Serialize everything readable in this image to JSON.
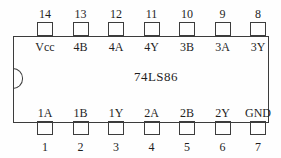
{
  "chip": {
    "part_number": "74LS86",
    "package": "DIP-14",
    "colors": {
      "ink": "#3c3c3c",
      "text": "#1e1e1e",
      "background": "#fefefe"
    },
    "top_pins": [
      {
        "number": "14",
        "label": "Vcc"
      },
      {
        "number": "13",
        "label": "4B"
      },
      {
        "number": "12",
        "label": "4A"
      },
      {
        "number": "11",
        "label": "4Y"
      },
      {
        "number": "10",
        "label": "3B"
      },
      {
        "number": "9",
        "label": "3A"
      },
      {
        "number": "8",
        "label": "3Y"
      }
    ],
    "bottom_pins": [
      {
        "number": "1",
        "label": "1A"
      },
      {
        "number": "2",
        "label": "1B"
      },
      {
        "number": "3",
        "label": "1Y"
      },
      {
        "number": "4",
        "label": "2A"
      },
      {
        "number": "5",
        "label": "2B"
      },
      {
        "number": "6",
        "label": "2Y"
      },
      {
        "number": "7",
        "label": "GND"
      }
    ],
    "layout": {
      "first_pin_center_x": 45,
      "pin_pitch_x": 35.5
    }
  }
}
